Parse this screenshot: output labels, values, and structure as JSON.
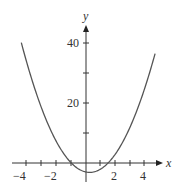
{
  "chart_data": {
    "type": "line",
    "title": "",
    "xlabel": "x",
    "ylabel": "y",
    "function": "y = 2x^2 - x - 3",
    "xlim": [
      -4.6,
      4.9
    ],
    "ylim": [
      -5,
      45
    ],
    "x_ticks": [
      -4,
      -3,
      -2,
      -1,
      1,
      2,
      3,
      4
    ],
    "x_tick_labels": [
      "-4",
      "-2",
      "2",
      "4"
    ],
    "y_ticks": [
      10,
      20,
      30,
      40
    ],
    "y_tick_labels": [
      "20",
      "40"
    ],
    "grid": false,
    "series": [
      {
        "name": "parabola",
        "x": [
          -4.4,
          -4,
          -3,
          -2,
          -1,
          0,
          0.25,
          1,
          1.5,
          2,
          3,
          4,
          4.7
        ],
        "y": [
          40.1,
          33,
          18,
          7,
          0,
          -3,
          -3.125,
          -2,
          0,
          3,
          12,
          25,
          36.5
        ]
      }
    ]
  },
  "labels": {
    "x_axis": "x",
    "y_axis": "y",
    "tick_neg4": "−4",
    "tick_neg2": "−2",
    "tick_2": "2",
    "tick_4": "4",
    "tick_20": "20",
    "tick_40": "40"
  }
}
